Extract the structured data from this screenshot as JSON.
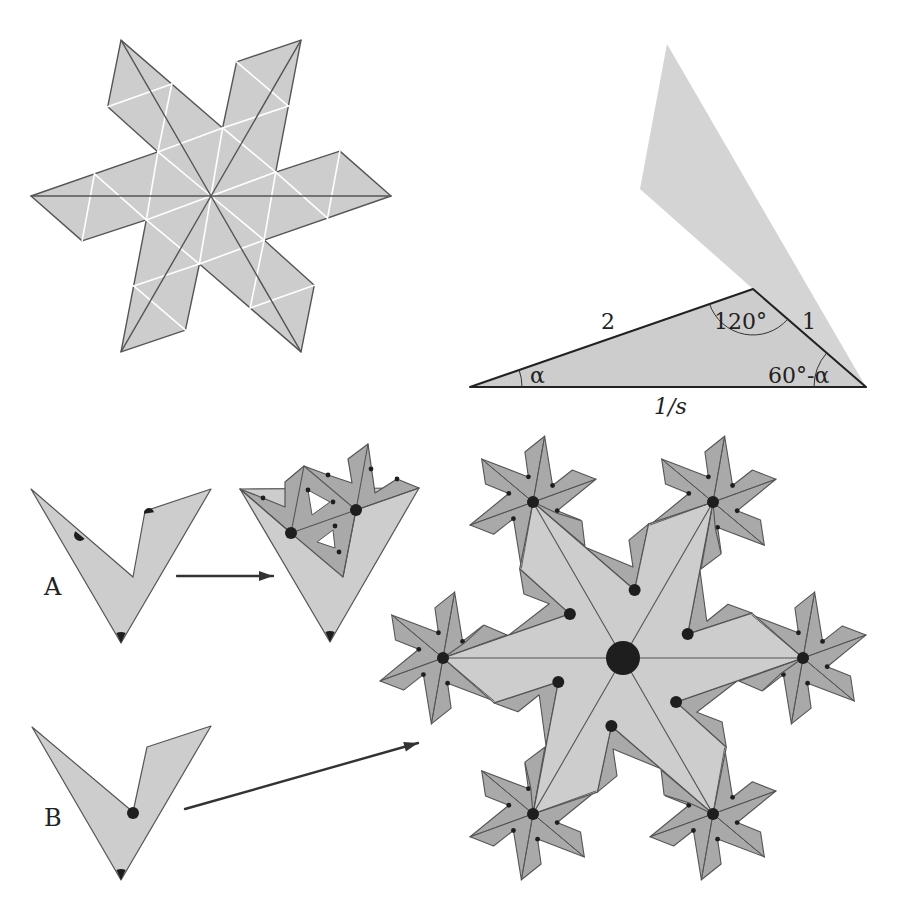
{
  "colors": {
    "background": "#ffffff",
    "light_fill": "#cdcdcd",
    "dark_fill": "#a9a9a9",
    "outline": "#555555",
    "white_line": "#ffffff",
    "dot": "#1e1e1e",
    "arrow": "#333333"
  },
  "panel_star": {
    "center": [
      211,
      196
    ],
    "scale": 1.0,
    "rotation_deg": 180,
    "show_white_lattice": true
  },
  "panel_triangle": {
    "vertices": {
      "left": [
        470,
        387
      ],
      "apex": [
        753,
        289
      ],
      "right": [
        866,
        387
      ]
    },
    "shadow_polygon": [
      [
        667,
        44
      ],
      [
        866,
        387
      ],
      [
        753,
        289
      ],
      [
        640,
        189
      ]
    ],
    "labels": {
      "side_left": "2",
      "side_right": "1",
      "base": "1/s",
      "angle_apex": "120°",
      "angle_left": "α",
      "angle_right": "60°-α"
    }
  },
  "panel_a": {
    "label": "A",
    "source_polygon": [
      [
        31,
        489
      ],
      [
        133,
        577
      ],
      [
        145,
        511
      ],
      [
        211,
        489
      ],
      [
        121,
        643
      ]
    ],
    "result_light_triangle": [
      [
        240,
        489
      ],
      [
        419,
        488
      ],
      [
        330,
        642
      ]
    ],
    "result_dark_polygon": [
      [
        240,
        489
      ],
      [
        263,
        498
      ],
      [
        285,
        507
      ],
      [
        285,
        482
      ],
      [
        304,
        466
      ],
      [
        328,
        475
      ],
      [
        352,
        483
      ],
      [
        348,
        459
      ],
      [
        368,
        444
      ],
      [
        375,
        493
      ],
      [
        397,
        479
      ],
      [
        419,
        488
      ],
      [
        356,
        510
      ],
      [
        343,
        577
      ],
      [
        291,
        533
      ]
    ],
    "result_holes": [
      [
        [
          308,
          490
        ],
        [
          330,
          502
        ],
        [
          312,
          515
        ]
      ],
      [
        [
          317,
          542
        ],
        [
          333,
          530
        ],
        [
          335,
          548
        ]
      ]
    ],
    "result_lines": [
      [
        [
          291,
          533
        ],
        [
          356,
          510
        ]
      ],
      [
        [
          304,
          466
        ],
        [
          291,
          533
        ]
      ],
      [
        [
          304,
          466
        ],
        [
          356,
          510
        ]
      ],
      [
        [
          368,
          444
        ],
        [
          356,
          510
        ]
      ],
      [
        [
          356,
          510
        ],
        [
          419,
          488
        ]
      ],
      [
        [
          240,
          489
        ],
        [
          291,
          533
        ]
      ],
      [
        [
          356,
          510
        ],
        [
          343,
          577
        ]
      ]
    ],
    "result_big_dots": [
      [
        291,
        533
      ],
      [
        356,
        510
      ]
    ],
    "result_small_dots": [
      [
        263,
        498
      ],
      [
        328,
        475
      ],
      [
        308,
        490
      ],
      [
        371,
        469
      ],
      [
        397,
        479
      ],
      [
        333,
        502
      ],
      [
        335,
        526
      ],
      [
        339,
        552
      ]
    ],
    "arrow": {
      "from": [
        177,
        576
      ],
      "to": [
        273,
        576
      ]
    }
  },
  "panel_b": {
    "label": "B",
    "source_polygon": [
      [
        32,
        727
      ],
      [
        133,
        812
      ],
      [
        147,
        747
      ],
      [
        211,
        726
      ],
      [
        121,
        880
      ]
    ],
    "dot": [
      133,
      813
    ],
    "arrow": {
      "from": [
        185,
        809
      ],
      "to": [
        418,
        743
      ]
    }
  },
  "panel_fractal": {
    "center": [
      623,
      658
    ],
    "scale": 1.0,
    "rotation_deg": 180,
    "center_dot_radius": 17,
    "sub_star_scale": 0.372,
    "sub_star_rotation_deg": 160
  }
}
